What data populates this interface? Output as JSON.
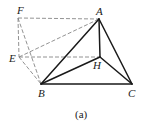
{
  "figure": {
    "caption": "(a)",
    "points": {
      "A": {
        "label": "A",
        "x": 99,
        "y": 19
      },
      "B": {
        "label": "B",
        "x": 41,
        "y": 84
      },
      "C": {
        "label": "C",
        "x": 132,
        "y": 84
      },
      "E": {
        "label": "E",
        "x": 19,
        "y": 57
      },
      "F": {
        "label": "F",
        "x": 18,
        "y": 18
      },
      "H": {
        "label": "H",
        "x": 100,
        "y": 57
      }
    },
    "solid_edges": [
      [
        "A",
        "B"
      ],
      [
        "A",
        "H"
      ],
      [
        "A",
        "C"
      ],
      [
        "B",
        "H"
      ],
      [
        "H",
        "C"
      ],
      [
        "B",
        "C"
      ]
    ],
    "dashed_edges": [
      [
        "F",
        "A"
      ],
      [
        "F",
        "E"
      ],
      [
        "F",
        "B"
      ],
      [
        "E",
        "A"
      ],
      [
        "E",
        "H"
      ],
      [
        "E",
        "B"
      ]
    ],
    "colors": {
      "solid": "#1a1a1a",
      "dashed": "#777777",
      "background": "#ffffff"
    }
  }
}
